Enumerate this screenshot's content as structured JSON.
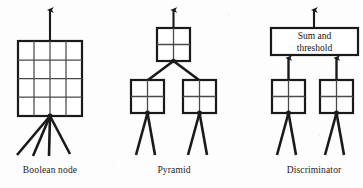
{
  "figure": {
    "title": "",
    "background_color": "#fdfdfd",
    "ink_color": "#1a1a1a"
  },
  "panels": [
    {
      "id": "boolean-node",
      "caption": "Boolean node",
      "node_type": "grid",
      "grid_rows": 4,
      "grid_cols": 4,
      "input_count": 4,
      "output_count": 1
    },
    {
      "id": "pyramid",
      "caption": "Pyramid",
      "node_type": "tree",
      "levels": 2,
      "top_nodes": 1,
      "bottom_nodes": 2,
      "grid_rows": 2,
      "grid_cols": 2,
      "inputs_per_bottom_node": 2,
      "output_count": 1
    },
    {
      "id": "discriminator",
      "caption": "Discriminator",
      "node_type": "sum-threshold",
      "summing_box_label_line1": "Sum and",
      "summing_box_label_line2": "threshold",
      "node_count": 2,
      "grid_rows": 2,
      "grid_cols": 2,
      "inputs_per_node": 2,
      "output_count": 1
    }
  ],
  "captions": {
    "boolean_node": "Boolean node",
    "pyramid": "Pyramid",
    "discriminator": "Discriminator"
  },
  "labels": {
    "sum_and": "Sum and",
    "threshold": "threshold"
  }
}
